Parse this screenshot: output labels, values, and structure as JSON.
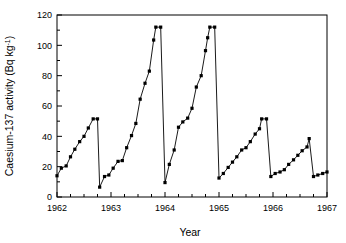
{
  "chart_data": {
    "type": "line",
    "title": "",
    "xlabel": "Year",
    "ylabel": "Caesium-137 activity (Bq kg-1)",
    "ylabel_main": "Caesium-137 activity (Bq kg",
    "ylabel_sup": "-1",
    "ylabel_tail": ")",
    "xlim": [
      1962,
      1967
    ],
    "ylim": [
      0,
      120
    ],
    "yticks": [
      0,
      20,
      40,
      60,
      80,
      100,
      120
    ],
    "ytick_labels": [
      "0",
      "20",
      "40",
      "60",
      "80",
      "100",
      "120"
    ],
    "xticks": [
      1962,
      1963,
      1964,
      1965,
      1966,
      1967
    ],
    "xtick_labels": [
      "1962",
      "1963",
      "1964",
      "1965",
      "1966",
      "1967"
    ],
    "xminor_step": 0.25,
    "grid": false,
    "legend": null,
    "marker": "filled-square",
    "marker_color": "#000000",
    "line_color": "#000000",
    "series": [
      {
        "name": "Caesium-137 activity",
        "x": [
          1962.0,
          1962.08,
          1962.17,
          1962.25,
          1962.33,
          1962.42,
          1962.5,
          1962.58,
          1962.67,
          1962.75,
          1962.79,
          1962.88,
          1962.96,
          1963.04,
          1963.13,
          1963.21,
          1963.29,
          1963.38,
          1963.46,
          1963.54,
          1963.63,
          1963.71,
          1963.79,
          1963.83,
          1963.92,
          1964.0,
          1964.08,
          1964.17,
          1964.25,
          1964.33,
          1964.42,
          1964.5,
          1964.58,
          1964.67,
          1964.75,
          1964.79,
          1964.83,
          1964.92,
          1965.0,
          1965.08,
          1965.17,
          1965.25,
          1965.33,
          1965.42,
          1965.5,
          1965.58,
          1965.67,
          1965.75,
          1965.79,
          1965.88,
          1965.96,
          1966.04,
          1966.13,
          1966.21,
          1966.29,
          1966.38,
          1966.46,
          1966.54,
          1966.63,
          1966.67,
          1966.75,
          1966.83,
          1966.92,
          1967.0
        ],
        "values": [
          14.0,
          19.0,
          20.5,
          26.5,
          31.5,
          36.5,
          40.0,
          45.5,
          51.5,
          51.5,
          6.5,
          13.5,
          14.5,
          19.0,
          23.5,
          24.0,
          32.5,
          40.5,
          48.5,
          64.5,
          75.0,
          83.0,
          103.5,
          112.0,
          112.0,
          9.5,
          21.5,
          31.0,
          46.0,
          49.5,
          52.0,
          58.5,
          72.5,
          80.0,
          96.5,
          105.0,
          112.0,
          112.0,
          12.5,
          15.5,
          19.5,
          23.0,
          26.5,
          31.0,
          32.5,
          36.5,
          41.5,
          45.0,
          51.5,
          51.5,
          13.5,
          15.5,
          16.5,
          18.0,
          21.5,
          24.5,
          27.5,
          30.5,
          33.0,
          38.5,
          13.5,
          14.5,
          15.5,
          16.5
        ]
      }
    ],
    "peaks": [
      51.5,
      112.0,
      112.0,
      51.5,
      38.5
    ],
    "troughs": [
      6.5,
      9.5,
      12.5,
      13.5,
      13.5
    ]
  },
  "style": {
    "axis_color": "#000000",
    "background": "#ffffff",
    "marker_size_px": 3.2
  }
}
